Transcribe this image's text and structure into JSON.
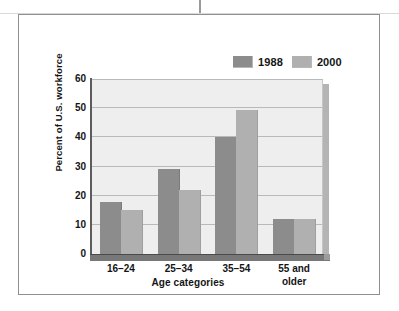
{
  "chart_data": {
    "type": "bar",
    "title": "",
    "xlabel": "Age categories",
    "ylabel": "Percent of U.S. workforce",
    "categories": [
      "16–24",
      "25–34",
      "35–54",
      "55 and older"
    ],
    "series": [
      {
        "name": "1988",
        "color": "#8c8c8c",
        "values": [
          18,
          29,
          40,
          12
        ]
      },
      {
        "name": "2000",
        "color": "#b0b0b0",
        "values": [
          15,
          22,
          49.5,
          12
        ]
      }
    ],
    "ylim": [
      0,
      60
    ],
    "yticks": [
      0,
      10,
      20,
      30,
      40,
      50,
      60
    ],
    "ytick_labels": [
      "0",
      "10",
      "20",
      "30",
      "40",
      "50",
      "60"
    ],
    "grid": true,
    "legend_position": "top-right"
  },
  "legend": {
    "items": [
      {
        "label": "1988",
        "swatch": "legend-swatch-1988"
      },
      {
        "label": "2000",
        "swatch": "legend-swatch-2000"
      }
    ]
  },
  "axes": {
    "y_title": "Percent of U.S. workforce",
    "x_title": "Age categories"
  }
}
